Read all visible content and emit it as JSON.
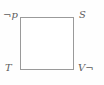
{
  "diagram": {
    "type": "square-frame-diagram",
    "background_color": "#fefefe",
    "frame": {
      "name": "square",
      "fill_color": "#ffffff",
      "stroke_color": "#9a9a9a",
      "stroke_width_px": 1,
      "x_px": 20,
      "y_px": 17,
      "width_px": 54,
      "height_px": 53
    },
    "labels": {
      "top_left": "¬p",
      "top_right": "S",
      "bottom_left": "T",
      "bottom_right": "V¬"
    },
    "label_style": {
      "color": "#5c5c5c",
      "italic": true,
      "font_size_px": 10
    }
  }
}
